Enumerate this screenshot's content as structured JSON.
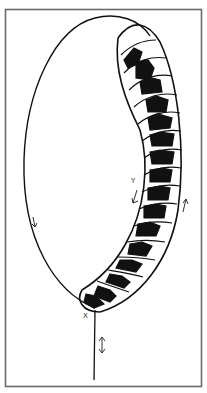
{
  "diagram": {
    "type": "line-drawing",
    "frame": {
      "stroke": "#6a6a6a"
    },
    "colors": {
      "ink": "#111111",
      "fill": "#ffffff"
    },
    "labels": {
      "x": "X",
      "y": "Y"
    },
    "arrows": [
      {
        "id": "left-loop-arrow",
        "direction": "down"
      },
      {
        "id": "y-arrow",
        "direction": "down-left"
      },
      {
        "id": "right-arrow",
        "direction": "up"
      },
      {
        "id": "stalk-arrow",
        "direction": "up-down"
      }
    ],
    "segment_count": 16
  }
}
